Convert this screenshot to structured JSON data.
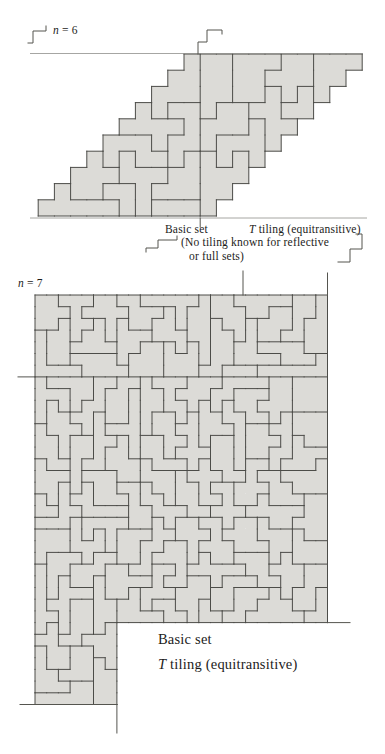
{
  "colors": {
    "paper": "#ffffff",
    "tile_fill": "#dcdbd7",
    "tile_edge": "#4c4c48",
    "rule": "#8f8f8b",
    "mark": "#55554f",
    "text": "#1c1c1a"
  },
  "n6": {
    "label_var": "n",
    "label_rest": " = 6",
    "caption_basic": "Basic set",
    "caption_T_var": "T",
    "caption_T_rest": " tiling (equitransitive)",
    "note_line1": "(No tiling known for reflective",
    "note_line2": "or full sets)"
  },
  "n7": {
    "label_var": "n",
    "label_rest": " = 7",
    "caption_basic": "Basic set",
    "caption_T_var": "T",
    "caption_T_rest": " tiling (equitransitive)"
  },
  "figures": {
    "n6": {
      "unit": 16.2,
      "cols": 11,
      "rows": 10,
      "shear": true,
      "x0": 184,
      "y0": 54,
      "piece_size": 6,
      "seed": 11,
      "fault_x": 1,
      "rules": [
        [
          [
            30,
            53.5
          ],
          [
            363,
            53.5
          ]
        ],
        [
          [
            30,
            218
          ],
          [
            367,
            218
          ]
        ]
      ],
      "marks": [
        [
          [
            28,
            43
          ],
          [
            33,
            43
          ],
          [
            33,
            31
          ],
          [
            46,
            31
          ],
          [
            46,
            26
          ]
        ],
        [
          [
            198,
            54
          ],
          [
            198,
            42
          ],
          [
            207,
            42
          ],
          [
            207,
            30
          ],
          [
            222,
            30
          ],
          [
            222,
            34
          ]
        ],
        [
          [
            146,
            252
          ],
          [
            146,
            248
          ],
          [
            158,
            248
          ],
          [
            158,
            240
          ],
          [
            177,
            240
          ],
          [
            177,
            236
          ]
        ],
        [
          [
            338,
            262
          ],
          [
            350,
            262
          ],
          [
            350,
            249
          ],
          [
            362,
            249
          ],
          [
            362,
            234
          ],
          [
            356,
            234
          ]
        ],
        [
          [
            200.2,
            218
          ],
          [
            200.2,
            227
          ]
        ]
      ]
    },
    "n7": {
      "unit": 11.7,
      "cols": 25,
      "rows": 28,
      "ext_cols": 7,
      "ext_rows": 7,
      "x0": 35,
      "y0": 295,
      "piece_size": 7,
      "seed": 23,
      "fault_y": 7,
      "rules": [],
      "marks": [
        [
          [
            243,
            271
          ],
          [
            243,
            295
          ]
        ],
        [
          [
            327.5,
            273
          ],
          [
            327.5,
            295
          ]
        ],
        [
          [
            18,
            376.9
          ],
          [
            35,
            376.9
          ]
        ],
        [
          [
            327.5,
            622.6
          ],
          [
            350,
            622.6
          ]
        ],
        [
          [
            20,
            704.5
          ],
          [
            116.9,
            704.5
          ]
        ],
        [
          [
            116.9,
            704.5
          ],
          [
            116.9,
            733
          ]
        ]
      ]
    }
  }
}
